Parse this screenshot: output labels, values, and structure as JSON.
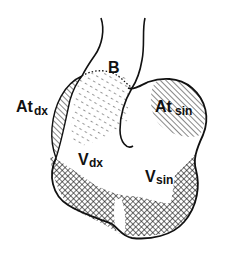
{
  "diagram": {
    "type": "anatomical-heart-sketch",
    "colors": {
      "ink": "#111111",
      "background": "#ffffff"
    },
    "labels": {
      "B": {
        "main": "B",
        "sub": ""
      },
      "at_dx": {
        "main": "At",
        "sub": "dx"
      },
      "at_sin": {
        "main": "At",
        "sub": "sin"
      },
      "v_dx": {
        "main": "V",
        "sub": "dx"
      },
      "v_sin": {
        "main": "V",
        "sub": "sin"
      }
    },
    "regions": [
      {
        "name": "At dx",
        "fill": "diagonal-hatch"
      },
      {
        "name": "At sin",
        "fill": "diagonal-hatch"
      },
      {
        "name": "B",
        "fill": "dash-stipple"
      },
      {
        "name": "V dx",
        "fill": "cross-hatch"
      },
      {
        "name": "V sin",
        "fill": "cross-hatch"
      }
    ]
  }
}
